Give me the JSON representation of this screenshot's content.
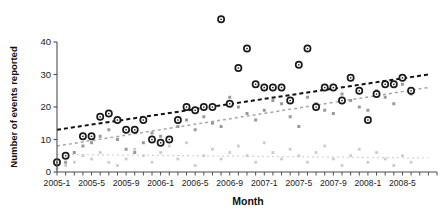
{
  "chart_data": {
    "type": "scatter",
    "title": "",
    "xlabel": "Month",
    "ylabel": "Number of events reported",
    "xlim": [
      0,
      44
    ],
    "ylim": [
      0,
      44
    ],
    "ytick_values": [
      0,
      10,
      20,
      30,
      40
    ],
    "ytick_labels": [
      "0",
      "10",
      "20",
      "30",
      "40"
    ],
    "xtick_labels": [
      "2005-1",
      "2005-5",
      "2005-9",
      "2006-1",
      "2006-5",
      "2006-9",
      "2007-1",
      "2007-5",
      "2007-9",
      "2008-1",
      "2008-5"
    ],
    "xtick_positions": [
      0,
      4,
      8,
      12,
      16,
      20,
      24,
      28,
      32,
      36,
      40
    ],
    "minor_ticks": 44,
    "grid": false,
    "legend": "none",
    "colors": {
      "series_dark": "#1a1a1a",
      "series_mid": "#9a9a9a",
      "series_light": "#cccccc",
      "trend_dark": "#111111",
      "trend_mid": "#a6a6a6",
      "trend_light": "#d2d2d2",
      "axis": "#4d4d4d",
      "background": "#ffffff"
    },
    "series": [
      {
        "name": "series-dark",
        "marker": "open-circle-dark",
        "x": [
          0,
          1,
          3,
          4,
          5,
          6,
          7,
          8,
          9,
          10,
          11,
          12,
          13,
          14,
          15,
          16,
          17,
          18,
          19,
          20,
          21,
          22,
          23,
          24,
          25,
          26,
          27,
          28,
          29,
          30,
          31,
          32,
          33,
          34,
          35,
          36,
          37,
          38,
          39,
          40,
          41
        ],
        "y": [
          3,
          5,
          11,
          11,
          17,
          18,
          16,
          13,
          13,
          16,
          10,
          9,
          10,
          16,
          20,
          19,
          20,
          20,
          47,
          21,
          32,
          38,
          27,
          26,
          26,
          26,
          22,
          33,
          38,
          20,
          26,
          26,
          22,
          29,
          25,
          16,
          24,
          27,
          27,
          29,
          25
        ]
      },
      {
        "name": "series-mid",
        "marker": "filled-square-gray",
        "x": [
          0,
          1,
          2,
          3,
          4,
          5,
          6,
          7,
          8,
          9,
          10,
          11,
          12,
          13,
          14,
          15,
          16,
          17,
          18,
          19,
          20,
          21,
          22,
          23,
          24,
          25,
          26,
          27,
          28,
          29,
          30,
          31,
          32,
          33,
          34,
          35,
          36,
          37,
          38,
          39,
          40,
          41
        ],
        "y": [
          2,
          3,
          6,
          8,
          9,
          11,
          13,
          10,
          7,
          6,
          9,
          12,
          11,
          10,
          14,
          16,
          13,
          17,
          15,
          14,
          23,
          20,
          18,
          16,
          19,
          22,
          21,
          17,
          14,
          23,
          21,
          19,
          18,
          24,
          22,
          20,
          19,
          25,
          23,
          21,
          27,
          24
        ]
      },
      {
        "name": "series-light",
        "marker": "filled-square-light",
        "x": [
          0,
          1,
          2,
          3,
          4,
          5,
          6,
          7,
          8,
          9,
          10,
          11,
          12,
          13,
          14,
          15,
          16,
          17,
          18,
          19,
          20,
          21,
          22,
          23,
          24,
          25,
          26,
          27,
          28,
          29,
          30,
          31,
          32,
          33,
          34,
          35,
          36,
          37,
          38,
          39,
          40,
          41
        ],
        "y": [
          1,
          2,
          3,
          5,
          4,
          6,
          3,
          2,
          4,
          7,
          5,
          3,
          6,
          8,
          4,
          9,
          2,
          5,
          7,
          4,
          6,
          8,
          5,
          3,
          9,
          6,
          4,
          7,
          5,
          3,
          6,
          8,
          4,
          2,
          5,
          7,
          3,
          6,
          4,
          2,
          5,
          3
        ]
      }
    ],
    "trendlines": [
      {
        "name": "trend-dark",
        "style": "dashed",
        "x0": 0,
        "y0": 13,
        "x1": 43,
        "y1": 30
      },
      {
        "name": "trend-mid",
        "style": "dashed",
        "x0": 0,
        "y0": 8,
        "x1": 43,
        "y1": 26
      },
      {
        "name": "trend-light",
        "style": "dotted",
        "x0": 0,
        "y0": 5.4,
        "x1": 43,
        "y1": 4.3
      }
    ]
  }
}
